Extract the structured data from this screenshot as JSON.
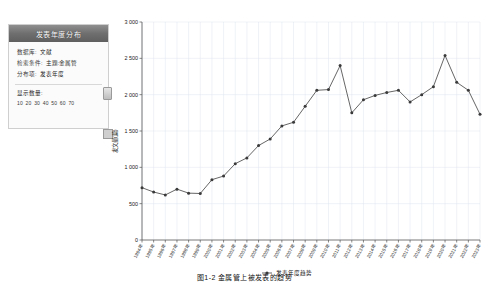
{
  "panel": {
    "title": "发表年度分布",
    "rows": [
      {
        "label": "数据库:",
        "value": "文献"
      },
      {
        "label": "检索条件:",
        "value": "主题:金属管"
      },
      {
        "label": "分布项:",
        "value": "发表年度"
      }
    ],
    "slider": {
      "title": "显示数量:",
      "ticks": [
        "10",
        "20",
        "30",
        "40",
        "50",
        "60",
        "70"
      ]
    }
  },
  "caption": "图1-2  金属管上被发表的趋势",
  "chart_data": {
    "type": "line",
    "title": "",
    "xlabel": "",
    "ylabel": "发文量(篇)",
    "legend": [
      "发表年度趋势"
    ],
    "legend_position": "bottom",
    "grid": true,
    "ylim": [
      0,
      3000
    ],
    "yticks": [
      0,
      500,
      1000,
      1500,
      2000,
      2500,
      3000
    ],
    "ytick_labels": [
      "0",
      "500",
      "1 000",
      "1 500",
      "2 000",
      "2 500",
      "3 000"
    ],
    "categories": [
      "1994年",
      "1995年",
      "1996年",
      "1997年",
      "1998年",
      "1999年",
      "2000年",
      "2001年",
      "2002年",
      "2003年",
      "2004年",
      "2005年",
      "2006年",
      "2007年",
      "2008年",
      "2009年",
      "2010年",
      "2011年",
      "2012年",
      "2013年",
      "2014年",
      "2015年",
      "2016年",
      "2017年",
      "2018年",
      "2019年",
      "2020年",
      "2021年",
      "2022年",
      "2023年"
    ],
    "values": [
      720,
      660,
      620,
      700,
      645,
      640,
      830,
      880,
      1050,
      1130,
      1300,
      1390,
      1570,
      1620,
      1840,
      2060,
      2070,
      2400,
      1750,
      1930,
      1990,
      2030,
      2060,
      1900,
      2000,
      2110,
      2540,
      2170,
      2060,
      1730
    ]
  }
}
